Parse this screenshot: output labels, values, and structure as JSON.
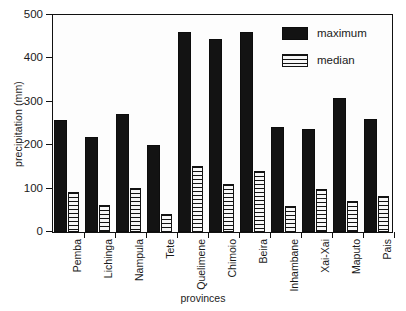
{
  "chart_data": {
    "type": "bar",
    "title": "",
    "subtitle": "",
    "xlabel": "provinces",
    "ylabel": "precipitation (mm)",
    "ylim": [
      0,
      500
    ],
    "yticks": [
      0,
      100,
      200,
      300,
      400,
      500
    ],
    "ytick_labels": [
      "0",
      "100",
      "200",
      "300",
      "400",
      "500"
    ],
    "grid": false,
    "legend_position": "top-right",
    "categories": [
      "Pemba",
      "Lichinga",
      "Nampula",
      "Tete",
      "Quelimene",
      "Chimoio",
      "Beira",
      "Inhambane",
      "Xai-Xai",
      "Maputo",
      "Pais"
    ],
    "series": [
      {
        "name": "maximum",
        "color": "#131313",
        "fill": "solid",
        "values": [
          257,
          220,
          272,
          201,
          460,
          444,
          460,
          241,
          237,
          309,
          260
        ]
      },
      {
        "name": "median",
        "color": "#131313",
        "fill": "horizontal-stripes",
        "values": [
          92,
          63,
          101,
          42,
          151,
          111,
          141,
          61,
          100,
          71,
          82
        ]
      }
    ]
  }
}
